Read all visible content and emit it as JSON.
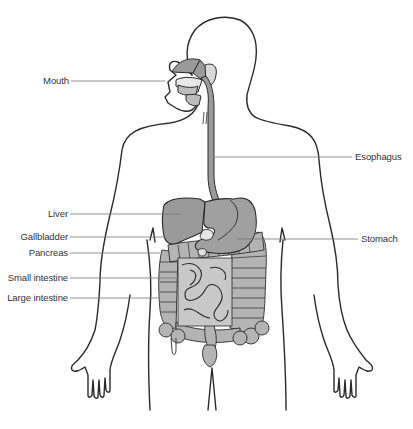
{
  "labels": {
    "mouth": "Mouth",
    "esophagus": "Esophagus",
    "liver": "Liver",
    "gallbladder": "Gallbladder",
    "stomach": "Stomach",
    "pancreas": "Pancreas",
    "small_intestine": "Small intestine",
    "large_intestine": "Large intestine"
  },
  "colors": {
    "outline": "#2a2a2a",
    "organ_fill": "#9a9a9a",
    "organ_dark": "#888888",
    "intestine_fill": "#b4b4b4",
    "leader_line": "#777777",
    "text": "#333333"
  }
}
